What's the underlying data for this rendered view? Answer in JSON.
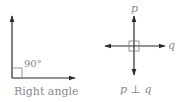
{
  "left_figure": {
    "angle_label": "90°",
    "caption": "Right angle"
  },
  "right_figure": {
    "vertical_label": "p",
    "horizontal_label": "q",
    "caption": "p ⊥ q"
  },
  "colors": {
    "line": "#2b2b2b",
    "marker": "#7a7a7a",
    "text": "#8a8a8a"
  }
}
